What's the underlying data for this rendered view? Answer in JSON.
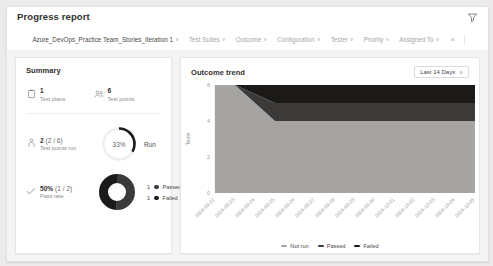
{
  "header": {
    "title": "Progress report",
    "filter_icon": "filter-icon"
  },
  "filters": {
    "scope": "Azure_DevOps_Practice Team_Stories_Iteration 1",
    "items": [
      {
        "label": "Test Suites"
      },
      {
        "label": "Outcome"
      },
      {
        "label": "Configuration"
      },
      {
        "label": "Tester"
      },
      {
        "label": "Priority"
      },
      {
        "label": "Assigned To"
      }
    ],
    "clear_label": "×",
    "chevron": "∨"
  },
  "summary": {
    "title": "Summary",
    "test_plans": {
      "icon": "clipboard-icon",
      "value": "1",
      "label": "Test plans"
    },
    "test_points": {
      "icon": "people-icon",
      "value": "6",
      "label": "Test points"
    },
    "test_points_run": {
      "icon": "person-run-icon",
      "value": "2",
      "fraction": "(2 / 6)",
      "label": "Test points run",
      "gauge_percent": "33%",
      "gauge_value": 33,
      "gauge_caption": "Run"
    },
    "pass_rate": {
      "icon": "check-icon",
      "value": "50%",
      "fraction": "(1 / 2)",
      "label": "Pass rate",
      "legend": [
        {
          "count": "1",
          "label": "Passed",
          "color": "#3b3a39"
        },
        {
          "count": "1",
          "label": "Failed",
          "color": "#1b1a19"
        }
      ],
      "donut": [
        {
          "label": "Passed",
          "value": 1,
          "color": "#3b3a39"
        },
        {
          "label": "Failed",
          "value": 1,
          "color": "#1b1a19"
        }
      ]
    }
  },
  "trend": {
    "title": "Outcome trend",
    "range_label": "Last 14 Days",
    "chevron": "∨"
  },
  "chart_data": {
    "type": "area",
    "title": "Outcome trend",
    "xlabel": "",
    "ylabel": "Tests",
    "ylim": [
      0,
      6
    ],
    "yticks": [
      "0",
      "2",
      "4",
      "6"
    ],
    "grid": false,
    "legend_position": "bottom",
    "categories": [
      "2024-09-22",
      "2024-09-23",
      "2024-09-24",
      "2024-09-25",
      "2024-09-26",
      "2024-09-27",
      "2024-09-28",
      "2024-09-29",
      "2024-09-30",
      "2024-10-01",
      "2024-10-02",
      "2024-10-03",
      "2024-10-04",
      "2024-10-05"
    ],
    "series": [
      {
        "name": "Not run",
        "color": "#a6a4a3",
        "values": [
          6,
          6,
          5,
          4,
          4,
          4,
          4,
          4,
          4,
          4,
          4,
          4,
          4,
          4
        ]
      },
      {
        "name": "Passed",
        "color": "#3b3a39",
        "values": [
          0,
          0,
          0.5,
          1,
          1,
          1,
          1,
          1,
          1,
          1,
          1,
          1,
          1,
          1
        ]
      },
      {
        "name": "Failed",
        "color": "#1b1a19",
        "values": [
          0,
          0,
          0.5,
          1,
          1,
          1,
          1,
          1,
          1,
          1,
          1,
          1,
          1,
          1
        ]
      }
    ]
  }
}
